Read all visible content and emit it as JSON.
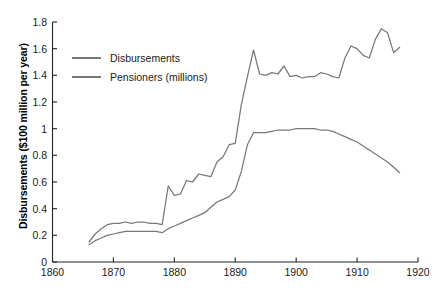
{
  "chart_data": {
    "type": "line",
    "title": "",
    "xlabel": "",
    "ylabel": "Disbursements ($100 million per year)",
    "xlim": [
      1860,
      1920
    ],
    "ylim": [
      0,
      1.8
    ],
    "grid": false,
    "legend_position": "upper-left-inside",
    "xticks": [
      1860,
      1870,
      1880,
      1890,
      1900,
      1910,
      1920
    ],
    "xtick_labels": [
      "1860",
      "1870",
      "1880",
      "1890",
      "1900",
      "1910",
      "1920"
    ],
    "yticks": [
      0,
      0.2,
      0.4,
      0.6,
      0.8,
      1,
      1.2,
      1.4,
      1.6,
      1.8
    ],
    "ytick_labels": [
      "0",
      "0.2",
      "0.4",
      "0.6",
      "0.8",
      "1",
      "1.2",
      "1.4",
      "1.6",
      "1.8"
    ],
    "line_color": "#787878",
    "axis_color": "#222222",
    "series": [
      {
        "name": "Disbursements",
        "x": [
          1866,
          1867,
          1868,
          1869,
          1870,
          1871,
          1872,
          1873,
          1874,
          1875,
          1876,
          1877,
          1878,
          1879,
          1880,
          1881,
          1882,
          1883,
          1884,
          1885,
          1886,
          1887,
          1888,
          1889,
          1890,
          1891,
          1892,
          1893,
          1894,
          1895,
          1896,
          1897,
          1898,
          1899,
          1900,
          1901,
          1902,
          1903,
          1904,
          1905,
          1906,
          1907,
          1908,
          1909,
          1910,
          1911,
          1912,
          1913,
          1914,
          1915,
          1916,
          1917
        ],
        "values": [
          0.15,
          0.21,
          0.25,
          0.28,
          0.29,
          0.29,
          0.3,
          0.29,
          0.3,
          0.3,
          0.29,
          0.29,
          0.28,
          0.57,
          0.5,
          0.51,
          0.61,
          0.6,
          0.66,
          0.65,
          0.64,
          0.75,
          0.79,
          0.88,
          0.89,
          1.18,
          1.39,
          1.59,
          1.41,
          1.4,
          1.42,
          1.41,
          1.47,
          1.39,
          1.4,
          1.38,
          1.39,
          1.39,
          1.42,
          1.41,
          1.39,
          1.38,
          1.53,
          1.62,
          1.6,
          1.55,
          1.53,
          1.67,
          1.75,
          1.72,
          1.57,
          1.61
        ]
      },
      {
        "name": "Pensioners (millions)",
        "x": [
          1866,
          1867,
          1868,
          1869,
          1870,
          1871,
          1872,
          1873,
          1874,
          1875,
          1876,
          1877,
          1878,
          1879,
          1880,
          1881,
          1882,
          1883,
          1884,
          1885,
          1886,
          1887,
          1888,
          1889,
          1890,
          1891,
          1892,
          1893,
          1894,
          1895,
          1896,
          1897,
          1898,
          1899,
          1900,
          1901,
          1902,
          1903,
          1904,
          1905,
          1906,
          1907,
          1908,
          1909,
          1910,
          1911,
          1912,
          1913,
          1914,
          1915,
          1916,
          1917
        ],
        "values": [
          0.13,
          0.16,
          0.18,
          0.2,
          0.21,
          0.22,
          0.23,
          0.23,
          0.23,
          0.23,
          0.23,
          0.23,
          0.22,
          0.25,
          0.27,
          0.29,
          0.31,
          0.33,
          0.35,
          0.37,
          0.41,
          0.45,
          0.47,
          0.49,
          0.54,
          0.68,
          0.88,
          0.97,
          0.97,
          0.97,
          0.98,
          0.99,
          0.99,
          0.99,
          1.0,
          1.0,
          1.0,
          1.0,
          0.99,
          0.99,
          0.98,
          0.96,
          0.94,
          0.92,
          0.9,
          0.87,
          0.84,
          0.81,
          0.78,
          0.75,
          0.71,
          0.67
        ]
      }
    ]
  },
  "legend": {
    "items": [
      {
        "label": "Disbursements"
      },
      {
        "label": "Pensioners (millions)"
      }
    ]
  }
}
